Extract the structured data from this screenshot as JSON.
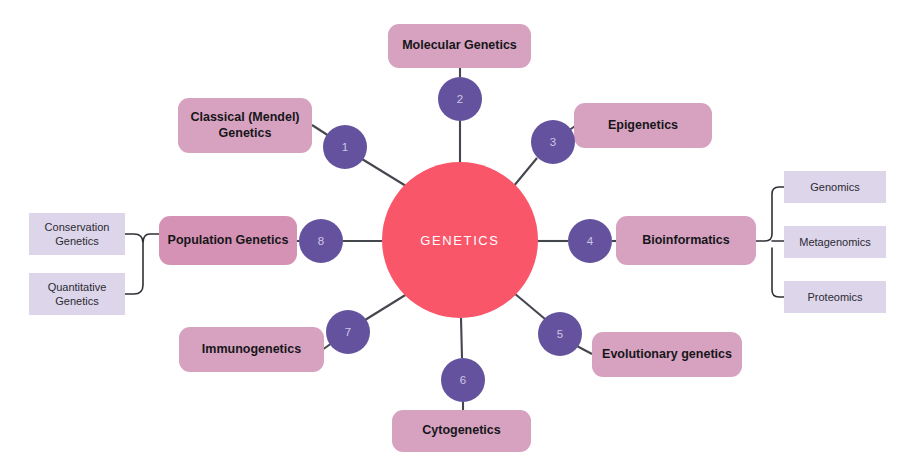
{
  "diagram": {
    "hub": {
      "label": "GENETICS",
      "color": "#f9566a",
      "cx": 460,
      "cy": 240,
      "r": 78
    },
    "colors": {
      "hub_fill": "#f9566a",
      "node_fill": "#d6a2c0",
      "node_fill_emphasis": "#d592b4",
      "leaf_fill": "#ddd5ea",
      "badge_fill": "#64529e",
      "badge_text": "#cfc7e4",
      "connector": "#45474f",
      "background": "#ffffff"
    },
    "branches": [
      {
        "number": "1",
        "label": "Classical (Mendel) Genetics",
        "label_lines": [
          "Classical (Mendel)",
          "Genetics"
        ],
        "badge": {
          "cx": 345,
          "cy": 147,
          "r": 22
        },
        "box": {
          "x": 178,
          "y": 98,
          "w": 134,
          "h": 55
        }
      },
      {
        "number": "2",
        "label": "Molecular Genetics",
        "label_lines": [
          "Molecular Genetics"
        ],
        "badge": {
          "cx": 460,
          "cy": 99,
          "r": 22
        },
        "box": {
          "x": 388,
          "y": 24,
          "w": 143,
          "h": 44
        }
      },
      {
        "number": "3",
        "label": "Epigenetics",
        "label_lines": [
          "Epigenetics"
        ],
        "badge": {
          "cx": 553,
          "cy": 142,
          "r": 22
        },
        "box": {
          "x": 574,
          "y": 103,
          "w": 138,
          "h": 45
        }
      },
      {
        "number": "4",
        "label": "Bioinformatics",
        "label_lines": [
          "Bioinformatics"
        ],
        "badge": {
          "cx": 590,
          "cy": 241,
          "r": 22
        },
        "box": {
          "x": 616,
          "y": 216,
          "w": 140,
          "h": 49
        },
        "children": [
          {
            "label": "Genomics",
            "box": {
              "x": 784,
              "y": 171,
              "w": 102,
              "h": 32
            }
          },
          {
            "label": "Metagenomics",
            "box": {
              "x": 784,
              "y": 226,
              "w": 102,
              "h": 32
            }
          },
          {
            "label": "Proteomics",
            "box": {
              "x": 784,
              "y": 281,
              "w": 102,
              "h": 32
            }
          }
        ]
      },
      {
        "number": "5",
        "label": "Evolutionary genetics",
        "label_lines": [
          "Evolutionary genetics"
        ],
        "badge": {
          "cx": 560,
          "cy": 334,
          "r": 22
        },
        "box": {
          "x": 592,
          "y": 332,
          "w": 150,
          "h": 45
        }
      },
      {
        "number": "6",
        "label": "Cytogenetics",
        "label_lines": [
          "Cytogenetics"
        ],
        "badge": {
          "cx": 463,
          "cy": 380,
          "r": 22
        },
        "box": {
          "x": 392,
          "y": 410,
          "w": 139,
          "h": 42
        }
      },
      {
        "number": "7",
        "label": "Immunogenetics",
        "label_lines": [
          "Immunogenetics"
        ],
        "badge": {
          "cx": 348,
          "cy": 332,
          "r": 22
        },
        "box": {
          "x": 179,
          "y": 327,
          "w": 145,
          "h": 45
        }
      },
      {
        "number": "8",
        "label": "Population Genetics",
        "label_lines": [
          "Population Genetics"
        ],
        "badge": {
          "cx": 321,
          "cy": 241,
          "r": 22
        },
        "box": {
          "x": 159,
          "y": 216,
          "w": 138,
          "h": 49
        },
        "children": [
          {
            "label": "Conservation Genetics",
            "label_lines": [
              "Conservation",
              "Genetics"
            ],
            "box": {
              "x": 29,
              "y": 213,
              "w": 96,
              "h": 42
            }
          },
          {
            "label": "Quantitative Genetics",
            "label_lines": [
              "Quantitative",
              "Genetics"
            ],
            "box": {
              "x": 29,
              "y": 273,
              "w": 96,
              "h": 42
            }
          }
        ]
      }
    ]
  }
}
